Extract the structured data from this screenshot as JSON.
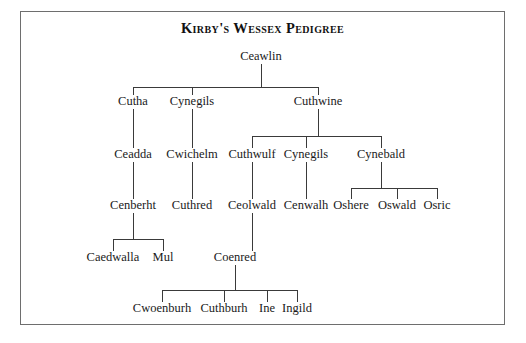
{
  "document": {
    "title": "Kirby's Wessex Pedigree",
    "border_color": "#6e6e6e",
    "line_color": "#3a3a3a",
    "text_color": "#1a1a1a",
    "background": "#ffffff"
  },
  "chart_data": {
    "type": "tree",
    "title": "Kirby's Wessex Pedigree",
    "orientation": "top-down",
    "generations": 6,
    "nodes": [
      {
        "id": "ceawlin",
        "label": "Ceawlin",
        "x": 261,
        "y": 60,
        "gen": 0
      },
      {
        "id": "cutha",
        "label": "Cutha",
        "x": 133,
        "y": 105,
        "gen": 1
      },
      {
        "id": "cynegils1",
        "label": "Cynegils",
        "x": 192,
        "y": 105,
        "gen": 1
      },
      {
        "id": "cuthwine",
        "label": "Cuthwine",
        "x": 318,
        "y": 105,
        "gen": 1
      },
      {
        "id": "ceadda",
        "label": "Ceadda",
        "x": 133,
        "y": 158,
        "gen": 2
      },
      {
        "id": "cwichelm",
        "label": "Cwichelm",
        "x": 192,
        "y": 158,
        "gen": 2
      },
      {
        "id": "cuthwulf",
        "label": "Cuthwulf",
        "x": 252,
        "y": 158,
        "gen": 2
      },
      {
        "id": "cynegils2",
        "label": "Cynegils",
        "x": 306,
        "y": 158,
        "gen": 2
      },
      {
        "id": "cynebald",
        "label": "Cynebald",
        "x": 381,
        "y": 158,
        "gen": 2
      },
      {
        "id": "cenberht",
        "label": "Cenberht",
        "x": 133,
        "y": 209,
        "gen": 3
      },
      {
        "id": "cuthred",
        "label": "Cuthred",
        "x": 192,
        "y": 209,
        "gen": 3
      },
      {
        "id": "ceolwald",
        "label": "Ceolwald",
        "x": 252,
        "y": 209,
        "gen": 3
      },
      {
        "id": "cenwalh",
        "label": "Cenwalh",
        "x": 306,
        "y": 209,
        "gen": 3
      },
      {
        "id": "oshere",
        "label": "Oshere",
        "x": 351,
        "y": 209,
        "gen": 3
      },
      {
        "id": "oswald",
        "label": "Oswald",
        "x": 397,
        "y": 209,
        "gen": 3
      },
      {
        "id": "osric",
        "label": "Osric",
        "x": 437,
        "y": 209,
        "gen": 3
      },
      {
        "id": "caedwalla",
        "label": "Caedwalla",
        "x": 113,
        "y": 261,
        "gen": 4
      },
      {
        "id": "mul",
        "label": "Mul",
        "x": 163,
        "y": 261,
        "gen": 4
      },
      {
        "id": "coenred",
        "label": "Coenred",
        "x": 235,
        "y": 261,
        "gen": 4
      },
      {
        "id": "cwoenburh",
        "label": "Cwoenburh",
        "x": 162,
        "y": 312,
        "gen": 5
      },
      {
        "id": "cuthburh",
        "label": "Cuthburh",
        "x": 224,
        "y": 312,
        "gen": 5
      },
      {
        "id": "ine",
        "label": "Ine",
        "x": 267,
        "y": 312,
        "gen": 5
      },
      {
        "id": "ingild",
        "label": "Ingild",
        "x": 297,
        "y": 312,
        "gen": 5
      }
    ],
    "edges": [
      {
        "parent": "ceawlin",
        "children": [
          "cutha",
          "cynegils1",
          "cuthwine"
        ],
        "bus_y": 87
      },
      {
        "parent": "cutha",
        "children": [
          "ceadda"
        ],
        "bus_y": 135
      },
      {
        "parent": "cynegils1",
        "children": [
          "cwichelm"
        ],
        "bus_y": 135
      },
      {
        "parent": "cuthwine",
        "children": [
          "cuthwulf",
          "cynegils2",
          "cynebald"
        ],
        "bus_y": 136
      },
      {
        "parent": "ceadda",
        "children": [
          "cenberht"
        ],
        "bus_y": 188
      },
      {
        "parent": "cwichelm",
        "children": [
          "cuthred"
        ],
        "bus_y": 188
      },
      {
        "parent": "cuthwulf",
        "children": [
          "ceolwald"
        ],
        "bus_y": 188
      },
      {
        "parent": "cynegils2",
        "children": [
          "cenwalh"
        ],
        "bus_y": 188
      },
      {
        "parent": "cynebald",
        "children": [
          "oshere",
          "oswald",
          "osric"
        ],
        "bus_y": 188
      },
      {
        "parent": "cenberht",
        "children": [
          "caedwalla",
          "mul"
        ],
        "bus_y": 239
      },
      {
        "parent": "ceolwald",
        "children": [
          "coenred"
        ],
        "bus_y": 239
      },
      {
        "parent": "coenred",
        "children": [
          "cwoenburh",
          "cuthburh",
          "ine",
          "ingild"
        ],
        "bus_y": 290
      }
    ]
  }
}
